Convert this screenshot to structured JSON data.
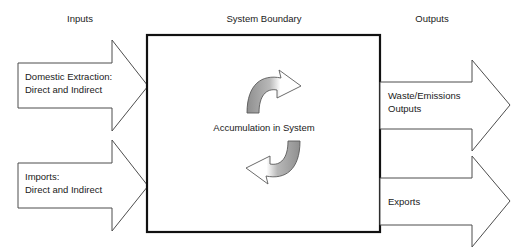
{
  "diagram": {
    "title_row": {
      "inputs_label": "Inputs",
      "boundary_label": "System Boundary",
      "outputs_label": "Outputs"
    },
    "center": {
      "accumulation_label": "Accumulation in System"
    },
    "input_arrows": [
      {
        "name": "domestic-extraction",
        "line1": "Domestic Extraction:",
        "line2": "Direct and Indirect"
      },
      {
        "name": "imports",
        "line1": "Imports:",
        "line2": "Direct and Indirect"
      }
    ],
    "output_arrows": [
      {
        "name": "waste-emissions",
        "line1": "Waste/Emissions",
        "line2": "Outputs"
      },
      {
        "name": "exports",
        "line1": "Exports",
        "line2": ""
      }
    ],
    "colors": {
      "background": "#ffffff",
      "boundary_stroke": "#111111",
      "arrow_stroke": "#4d4d4d",
      "text": "#1a1a1a",
      "cycle_fill_dark": "#9a9a9a",
      "cycle_fill_light": "#ffffff"
    }
  }
}
